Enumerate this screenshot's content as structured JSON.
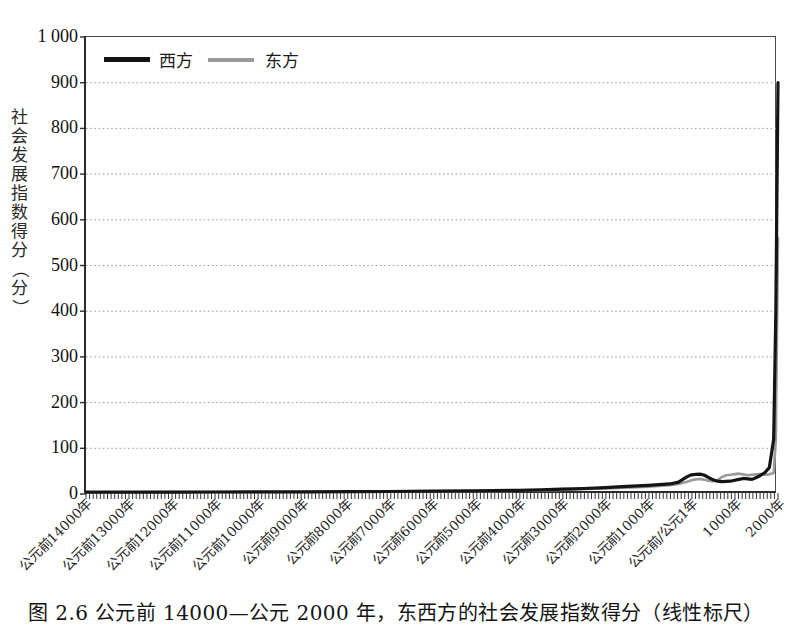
{
  "figure": {
    "caption": "图 2.6  公元前 14000—公元 2000 年，东西方的社会发展指数得分（线性标尺）"
  },
  "chart_data": {
    "type": "line",
    "title": "",
    "xlabel": "",
    "ylabel": "社会发展指数得分（分）",
    "ylim": [
      0,
      1000
    ],
    "ytick_labels": [
      "1 000",
      "900",
      "800",
      "700",
      "600",
      "500",
      "400",
      "300",
      "200",
      "100",
      "0"
    ],
    "ytick_values": [
      1000,
      900,
      800,
      700,
      600,
      500,
      400,
      300,
      200,
      100,
      0
    ],
    "grid": "horizontal-dotted",
    "legend_position": "top-left",
    "xtick_labels": [
      "公元前14000年",
      "公元前13000年",
      "公元前12000年",
      "公元前11000年",
      "公元前10000年",
      "公元前9000年",
      "公元前8000年",
      "公元前7000年",
      "公元前6000年",
      "公元前5000年",
      "公元前4000年",
      "公元前3000年",
      "公元前2000年",
      "公元前1000年",
      "公元前/公元1年",
      "1000年",
      "2000年"
    ],
    "xtick_values": [
      -14000,
      -13000,
      -12000,
      -11000,
      -10000,
      -9000,
      -8000,
      -7000,
      -6000,
      -5000,
      -4000,
      -3000,
      -2000,
      -1000,
      1,
      1000,
      2000
    ],
    "xlim": [
      -14000,
      2000
    ],
    "series": [
      {
        "name": "西方",
        "color": "#141414",
        "style": "solid-thick",
        "x": [
          -14000,
          -13000,
          -12000,
          -11000,
          -10000,
          -9000,
          -8000,
          -7000,
          -6000,
          -5000,
          -4000,
          -3500,
          -3000,
          -2500,
          -2000,
          -1500,
          -1000,
          -500,
          -300,
          -100,
          1,
          100,
          200,
          300,
          400,
          500,
          600,
          700,
          800,
          900,
          1000,
          1100,
          1200,
          1300,
          1400,
          1500,
          1600,
          1700,
          1800,
          1900,
          1950,
          2000
        ],
        "values": [
          4.0,
          4.2,
          4.3,
          4.4,
          4.5,
          4.7,
          5.0,
          5.5,
          6.2,
          7.0,
          8.0,
          9.0,
          10.5,
          12.0,
          14.0,
          16.5,
          19.0,
          22.0,
          26.0,
          38.0,
          42.0,
          43.0,
          43.5,
          41.0,
          36.0,
          31.0,
          28.0,
          27.0,
          27.5,
          28.0,
          30.0,
          32.0,
          34.0,
          33.0,
          32.0,
          36.0,
          41.0,
          47.0,
          58.0,
          120.0,
          400.0,
          900.0
        ]
      },
      {
        "name": "东方",
        "color": "#9a9a9a",
        "style": "solid",
        "x": [
          -14000,
          -13000,
          -12000,
          -11000,
          -10000,
          -9000,
          -8000,
          -7000,
          -6000,
          -5000,
          -4000,
          -3500,
          -3000,
          -2500,
          -2000,
          -1500,
          -1000,
          -500,
          -300,
          -100,
          1,
          100,
          200,
          300,
          400,
          500,
          600,
          700,
          800,
          900,
          1000,
          1100,
          1200,
          1300,
          1400,
          1500,
          1600,
          1700,
          1800,
          1900,
          1950,
          2000
        ],
        "values": [
          3.8,
          3.9,
          4.0,
          4.1,
          4.2,
          4.4,
          4.6,
          5.0,
          5.5,
          6.2,
          7.0,
          8.0,
          9.0,
          10.5,
          12.0,
          14.0,
          16.0,
          19.0,
          22.0,
          27.0,
          30.0,
          32.0,
          33.0,
          31.0,
          29.0,
          28.0,
          30.0,
          37.0,
          41.0,
          42.0,
          43.5,
          44.5,
          43.0,
          41.0,
          42.0,
          43.0,
          43.5,
          42.0,
          43.0,
          46.0,
          120.0,
          560.0
        ]
      }
    ],
    "legend": [
      {
        "label": "西方",
        "color": "#141414",
        "swatch": "thick-black-line"
      },
      {
        "label": "东方",
        "color": "#9a9a9a",
        "swatch": "gray-line"
      }
    ]
  }
}
